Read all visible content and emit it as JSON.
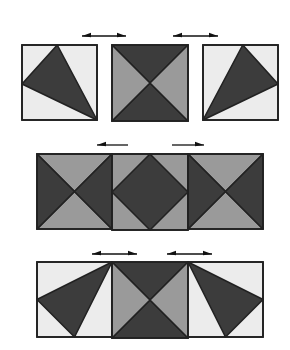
{
  "diagram": {
    "title": "",
    "colors": {
      "dark": "#3c3c3c",
      "medium": "#9a9a9a",
      "light": "#ececec",
      "stroke": "#222222",
      "background": "#ffffff"
    },
    "rows": [
      {
        "name": "separated-blocks",
        "arrows": [
          {
            "x1": 82,
            "x2": 126,
            "y": 36,
            "direction": "both"
          },
          {
            "x1": 173,
            "x2": 218,
            "y": 36,
            "direction": "both"
          }
        ],
        "squares": [
          {
            "x": 22,
            "y": 45,
            "size": 75,
            "pattern": "kite-left"
          },
          {
            "x": 112,
            "y": 45,
            "size": 76,
            "pattern": "hourglass-dark-vertical"
          },
          {
            "x": 203,
            "y": 45,
            "size": 75,
            "pattern": "kite-right"
          }
        ]
      },
      {
        "name": "joined-row-variant-1",
        "arrows": [
          {
            "x1": 97,
            "x2": 128,
            "y": 145,
            "direction": "left"
          },
          {
            "x1": 172,
            "x2": 204,
            "y": 145,
            "direction": "right"
          }
        ],
        "squares": [
          {
            "x": 37,
            "y": 154,
            "size": 75,
            "pattern": "hourglass-dark-horizontal"
          },
          {
            "x": 112,
            "y": 154,
            "size": 76,
            "pattern": "diamond"
          },
          {
            "x": 188,
            "y": 154,
            "size": 75,
            "pattern": "hourglass-dark-horizontal"
          }
        ]
      },
      {
        "name": "joined-row-variant-2",
        "arrows": [
          {
            "x1": 92,
            "x2": 137,
            "y": 254,
            "direction": "both"
          },
          {
            "x1": 167,
            "x2": 212,
            "y": 254,
            "direction": "both"
          }
        ],
        "squares": [
          {
            "x": 37,
            "y": 262,
            "size": 75,
            "pattern": "kite-left-b"
          },
          {
            "x": 112,
            "y": 262,
            "size": 76,
            "pattern": "hourglass-dark-vertical"
          },
          {
            "x": 188,
            "y": 262,
            "size": 75,
            "pattern": "kite-right-b"
          }
        ]
      }
    ]
  }
}
